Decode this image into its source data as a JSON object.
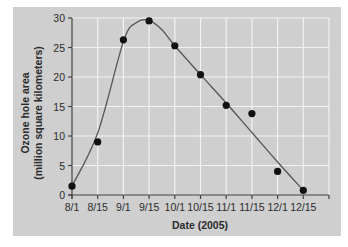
{
  "chart_data": {
    "type": "line",
    "title": "",
    "xlabel": "Date (2005)",
    "ylabel_line1": "Ozone hole area",
    "ylabel_line2": "(million square kilometers)",
    "ylabel": "Ozone hole area (million square kilometers)",
    "categories": [
      "8/1",
      "8/15",
      "9/1",
      "9/15",
      "10/1",
      "10/15",
      "11/1",
      "11/15",
      "12/1",
      "12/15"
    ],
    "series": [
      {
        "name": "Ozone hole area",
        "values": [
          1.5,
          9.0,
          26.3,
          29.5,
          25.3,
          20.4,
          15.2,
          13.8,
          4.0,
          0.8
        ],
        "style": "points with smooth fitted curve"
      }
    ],
    "fit_curve": {
      "x_index": [
        0,
        1,
        2,
        2.5,
        3,
        3.5,
        4,
        5,
        6,
        7,
        8,
        9
      ],
      "y": [
        1.5,
        10.5,
        26.0,
        29.2,
        29.6,
        28.0,
        25.3,
        20.4,
        15.6,
        10.6,
        5.6,
        0.8
      ]
    },
    "yticks": [
      0,
      5,
      10,
      15,
      20,
      25,
      30
    ],
    "ylim": [
      0,
      30
    ],
    "xlim": [
      "8/1",
      "1/1"
    ],
    "grid": true,
    "legend": null,
    "colors": {
      "panel_background": "#cfcfcf",
      "grid": "#f2f2f2",
      "axis": "#444444",
      "points": "#111111",
      "curve": "#555555"
    }
  }
}
